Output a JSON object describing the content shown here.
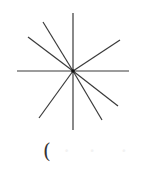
{
  "diagram": {
    "type": "star-of-lines",
    "center": [
      73,
      71
    ],
    "stroke_color": "#3a3a3a",
    "center_dot_color": "#111111",
    "lines": [
      {
        "name": "vertical",
        "from": [
          73,
          13
        ],
        "to": [
          73,
          130
        ]
      },
      {
        "name": "horizontal",
        "from": [
          17,
          71
        ],
        "to": [
          129,
          71
        ]
      },
      {
        "name": "upper-left-steep",
        "from": [
          73,
          71
        ],
        "to": [
          43,
          22
        ]
      },
      {
        "name": "upper-left-shallow",
        "from": [
          73,
          71
        ],
        "to": [
          28,
          37
        ]
      },
      {
        "name": "upper-right",
        "from": [
          73,
          71
        ],
        "to": [
          120,
          40
        ]
      },
      {
        "name": "lower-right-shallow",
        "from": [
          73,
          71
        ],
        "to": [
          118,
          106
        ]
      },
      {
        "name": "lower-right-steep",
        "from": [
          73,
          71
        ],
        "to": [
          102,
          120
        ]
      },
      {
        "name": "lower-left",
        "from": [
          73,
          71
        ],
        "to": [
          39,
          118
        ]
      }
    ]
  },
  "caption": {
    "open_paren": "(",
    "rest": "  ·   ·    ·"
  }
}
